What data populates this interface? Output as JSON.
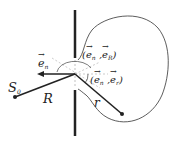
{
  "diagram": {
    "labels": {
      "source": "S",
      "source_sub": "0",
      "point": "P",
      "R": "R",
      "r": "r",
      "normal_vec": "e",
      "normal_sub": "n",
      "angle1_a": "e",
      "angle1_a_sub": "n",
      "angle1_b": "e",
      "angle1_b_sub": "R",
      "angle2_a": "e",
      "angle2_a_sub": "n",
      "angle2_b": "e",
      "angle2_b_sub": "r",
      "open": "(",
      "comma": ",",
      "close": ")"
    },
    "colors": {
      "line": "#222222",
      "dashed": "#999999"
    }
  }
}
